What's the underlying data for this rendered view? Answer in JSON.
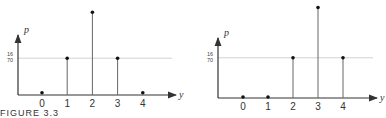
{
  "caption": "FIGURE 3.3",
  "chart_data": [
    {
      "type": "bar",
      "style": "stem",
      "title": "",
      "xlabel": "y",
      "ylabel": "p",
      "categories": [
        "0",
        "1",
        "2",
        "3",
        "4"
      ],
      "values": [
        0.0143,
        0.2286,
        0.5143,
        0.2286,
        0.0143
      ],
      "values_fraction": [
        "1/70",
        "16/70",
        "36/70",
        "16/70",
        "1/70"
      ],
      "reference_line": {
        "value": 0.2286,
        "label_num": "16",
        "label_den": "70"
      },
      "grid": false
    },
    {
      "type": "bar",
      "style": "stem",
      "title": "",
      "xlabel": "y",
      "ylabel": "p",
      "categories": [
        "0",
        "1",
        "2",
        "3",
        "4"
      ],
      "values": [
        0.0,
        0.0,
        0.2286,
        0.5143,
        0.2286
      ],
      "values_fraction": [
        "0",
        "0",
        "16/70",
        "36/70",
        "16/70"
      ],
      "reference_line": {
        "value": 0.2286,
        "label_num": "16",
        "label_den": "70"
      },
      "grid": false
    }
  ]
}
